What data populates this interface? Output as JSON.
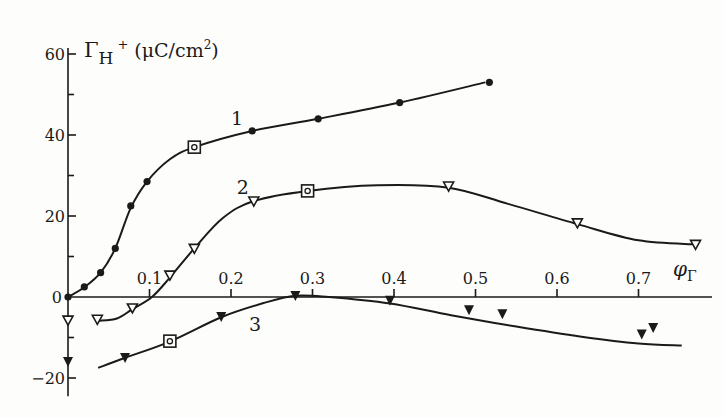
{
  "chart_data": {
    "type": "line",
    "title": "",
    "xlabel": "φ_Γ",
    "ylabel": "Γ_H+ (μC/cm²)",
    "xlim": [
      0,
      0.79
    ],
    "ylim": [
      -22,
      62
    ],
    "grid": false,
    "legend": "none (curves labelled inline 1, 2, 3)",
    "x_ticks": [
      0.1,
      0.2,
      0.3,
      0.4,
      0.5,
      0.6,
      0.7
    ],
    "x_tick_labels": [
      "0.1",
      "0.2",
      "0.3",
      "0.4",
      "0.5",
      "0.6",
      "0.7"
    ],
    "y_ticks": [
      -20,
      0,
      20,
      40,
      60
    ],
    "y_tick_labels": [
      "−20",
      "0",
      "20",
      "40",
      "60"
    ],
    "origin_label": "0",
    "series": [
      {
        "name": "1",
        "marker": "filled-circle",
        "points": [
          [
            0.0,
            0.0
          ],
          [
            0.02,
            2.5
          ],
          [
            0.04,
            6.0
          ],
          [
            0.058,
            12.0
          ],
          [
            0.077,
            22.5
          ],
          [
            0.097,
            28.5
          ],
          [
            0.155,
            37.0
          ],
          [
            0.226,
            41.0
          ],
          [
            0.307,
            44.0
          ],
          [
            0.407,
            48.0
          ],
          [
            0.517,
            53.0
          ]
        ],
        "highlighted_point": [
          0.155,
          37.0
        ],
        "curve": [
          [
            0.0,
            0.0
          ],
          [
            0.02,
            2.4
          ],
          [
            0.04,
            6.0
          ],
          [
            0.058,
            12.0
          ],
          [
            0.077,
            22.0
          ],
          [
            0.097,
            28.5
          ],
          [
            0.125,
            34.0
          ],
          [
            0.155,
            37.0
          ],
          [
            0.226,
            41.0
          ],
          [
            0.307,
            44.0
          ],
          [
            0.407,
            48.0
          ],
          [
            0.512,
            53.0
          ]
        ],
        "label_position": [
          0.2,
          42.5
        ]
      },
      {
        "name": "2",
        "marker": "open-triangle-down",
        "points": [
          [
            0.036,
            -5.5
          ],
          [
            0.079,
            -2.7
          ],
          [
            0.125,
            5.4
          ],
          [
            0.155,
            12.0
          ],
          [
            0.228,
            23.7
          ],
          [
            0.294,
            26.2
          ],
          [
            0.467,
            27.4
          ],
          [
            0.625,
            18.3
          ],
          [
            0.77,
            13.0
          ]
        ],
        "highlighted_point": [
          0.294,
          26.2
        ],
        "isolated_points": [
          [
            0.0,
            -5.7
          ]
        ],
        "curve": [
          [
            0.037,
            -5.9
          ],
          [
            0.06,
            -5.3
          ],
          [
            0.079,
            -3.0
          ],
          [
            0.103,
            0.0
          ],
          [
            0.125,
            4.8
          ],
          [
            0.155,
            12.0
          ],
          [
            0.19,
            19.5
          ],
          [
            0.228,
            23.7
          ],
          [
            0.294,
            26.2
          ],
          [
            0.38,
            27.6
          ],
          [
            0.467,
            27.0
          ],
          [
            0.54,
            23.0
          ],
          [
            0.625,
            18.0
          ],
          [
            0.7,
            14.0
          ],
          [
            0.77,
            13.0
          ]
        ],
        "label_position": [
          0.207,
          25.5
        ]
      },
      {
        "name": "3",
        "marker": "filled-triangle-down",
        "points": [
          [
            0.07,
            -14.8
          ],
          [
            0.125,
            -10.9
          ],
          [
            0.188,
            -4.7
          ],
          [
            0.279,
            0.5
          ],
          [
            0.395,
            -0.7
          ],
          [
            0.492,
            -3.0
          ],
          [
            0.533,
            -4.0
          ],
          [
            0.704,
            -9.0
          ],
          [
            0.718,
            -7.4
          ]
        ],
        "highlighted_point": [
          0.125,
          -10.9
        ],
        "isolated_points": [
          [
            0.0,
            -15.8
          ]
        ],
        "curve": [
          [
            0.037,
            -17.5
          ],
          [
            0.07,
            -15.0
          ],
          [
            0.125,
            -11.0
          ],
          [
            0.188,
            -5.0
          ],
          [
            0.24,
            -1.5
          ],
          [
            0.279,
            0.3
          ],
          [
            0.32,
            0.0
          ],
          [
            0.395,
            -1.6
          ],
          [
            0.47,
            -4.5
          ],
          [
            0.55,
            -7.3
          ],
          [
            0.63,
            -9.8
          ],
          [
            0.7,
            -11.5
          ],
          [
            0.753,
            -12.0
          ]
        ],
        "label_position": [
          0.222,
          -8.5
        ]
      }
    ]
  },
  "labels": {
    "y_axis_title_main": "Γ",
    "y_axis_title_sub": "H",
    "y_axis_title_sup": "+",
    "y_axis_units": "(μC/cm",
    "y_axis_units_sup": "2",
    "y_axis_units_close": ")",
    "x_axis_title_main": "φ",
    "x_axis_title_sub": "Γ"
  }
}
